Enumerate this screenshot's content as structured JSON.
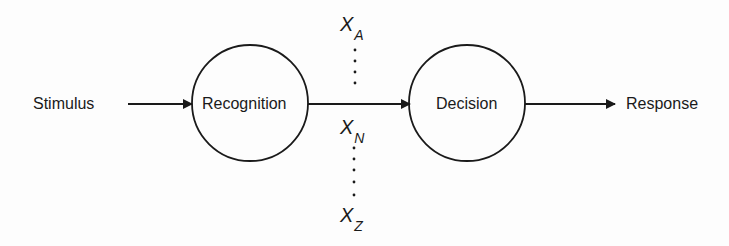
{
  "diagram": {
    "type": "flow",
    "nodes": [
      {
        "id": "stimulus",
        "label": "Stimulus",
        "shape": "text"
      },
      {
        "id": "recognition",
        "label": "Recognition",
        "shape": "circle"
      },
      {
        "id": "decision",
        "label": "Decision",
        "shape": "circle"
      },
      {
        "id": "response",
        "label": "Response",
        "shape": "text"
      }
    ],
    "edges": [
      {
        "from": "stimulus",
        "to": "recognition"
      },
      {
        "from": "recognition",
        "to": "decision"
      },
      {
        "from": "decision",
        "to": "response"
      }
    ],
    "variables": [
      {
        "base": "X",
        "sub": "A"
      },
      {
        "base": "X",
        "sub": "N"
      },
      {
        "base": "X",
        "sub": "Z"
      }
    ],
    "colors": {
      "stroke": "#1a1a1a",
      "background": "#fdfdfd"
    }
  }
}
